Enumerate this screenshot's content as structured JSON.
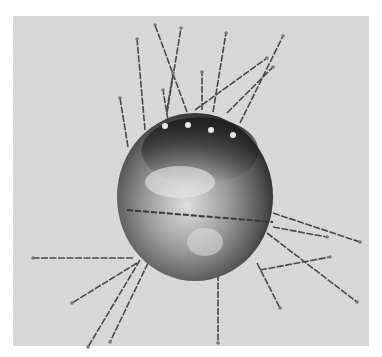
{
  "figure": {
    "background_panel": {
      "x": 13,
      "y": 16,
      "width": 356,
      "height": 330,
      "color": "#dcdcdc"
    },
    "sphere": {
      "cx": 195,
      "cy": 197,
      "rx": 78,
      "ry": 84,
      "dark": "#2a2a2a",
      "mid": "#7a7a7a",
      "light": "#d8d8d8"
    },
    "equator": {
      "x1": 127,
      "y1": 210,
      "x2": 273,
      "y2": 222
    },
    "electrode_dots": [
      {
        "x": 165,
        "y": 126
      },
      {
        "x": 188,
        "y": 125
      },
      {
        "x": 211,
        "y": 130
      },
      {
        "x": 233,
        "y": 135
      }
    ],
    "wires": [
      {
        "x1": 145,
        "y1": 130,
        "x2": 137,
        "y2": 39
      },
      {
        "x1": 187,
        "y1": 112,
        "x2": 155,
        "y2": 25
      },
      {
        "x1": 167,
        "y1": 113,
        "x2": 181,
        "y2": 28
      },
      {
        "x1": 213,
        "y1": 112,
        "x2": 226,
        "y2": 33
      },
      {
        "x1": 240,
        "y1": 123,
        "x2": 283,
        "y2": 36
      },
      {
        "x1": 195,
        "y1": 110,
        "x2": 267,
        "y2": 58
      },
      {
        "x1": 202,
        "y1": 110,
        "x2": 202,
        "y2": 72
      },
      {
        "x1": 128,
        "y1": 147,
        "x2": 120,
        "y2": 98
      },
      {
        "x1": 168,
        "y1": 120,
        "x2": 163,
        "y2": 90
      },
      {
        "x1": 167,
        "y1": 110,
        "x2": 173,
        "y2": 73
      },
      {
        "x1": 227,
        "y1": 113,
        "x2": 273,
        "y2": 67
      },
      {
        "x1": 133,
        "y1": 258,
        "x2": 33,
        "y2": 258
      },
      {
        "x1": 137,
        "y1": 263,
        "x2": 72,
        "y2": 303
      },
      {
        "x1": 140,
        "y1": 260,
        "x2": 88,
        "y2": 347
      },
      {
        "x1": 148,
        "y1": 263,
        "x2": 110,
        "y2": 342
      },
      {
        "x1": 218,
        "y1": 223,
        "x2": 218,
        "y2": 343
      },
      {
        "x1": 273,
        "y1": 213,
        "x2": 360,
        "y2": 242
      },
      {
        "x1": 267,
        "y1": 233,
        "x2": 357,
        "y2": 302
      },
      {
        "x1": 257,
        "y1": 263,
        "x2": 280,
        "y2": 308
      },
      {
        "x1": 260,
        "y1": 270,
        "x2": 330,
        "y2": 257
      },
      {
        "x1": 273,
        "y1": 227,
        "x2": 327,
        "y2": 237
      }
    ],
    "wire_color": "#4a4a4a"
  }
}
